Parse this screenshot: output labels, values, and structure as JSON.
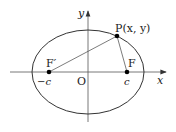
{
  "diagram": {
    "type": "ellipse-foci",
    "labels": {
      "y_axis": "y",
      "x_axis": "x",
      "origin": "O",
      "point_P": "P(x, y)",
      "focus_left": "F′",
      "focus_right": "F",
      "left_c": "−c",
      "right_c": "c"
    },
    "colors": {
      "stroke": "#333333",
      "axis": "#555555",
      "point": "#000000"
    }
  }
}
